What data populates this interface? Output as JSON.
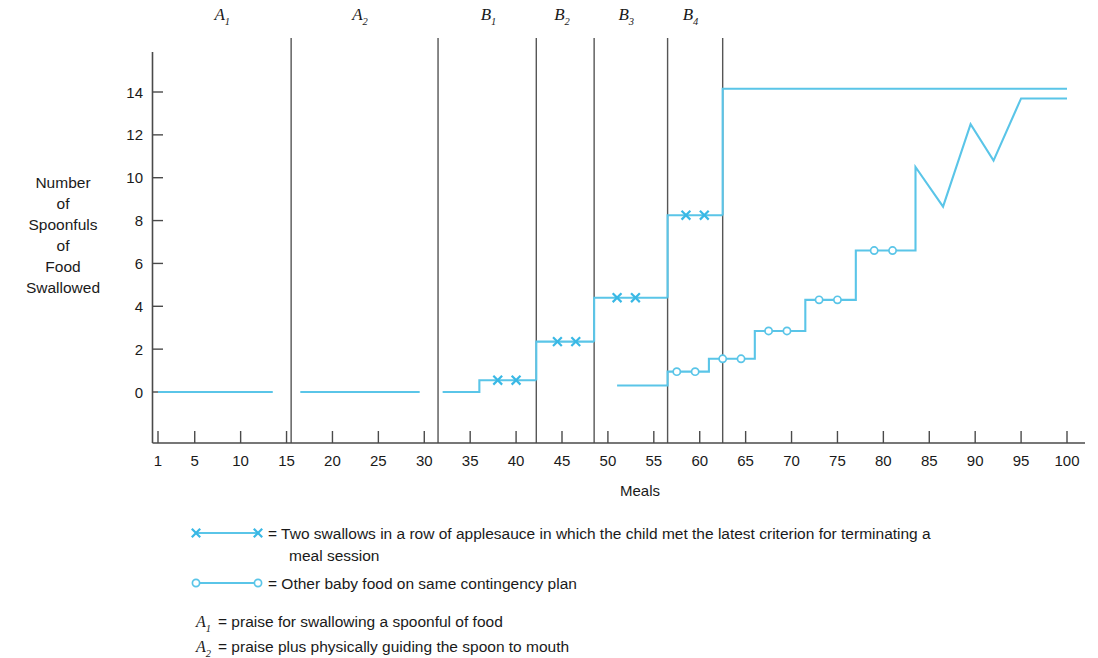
{
  "chart_data": {
    "type": "line",
    "title": "",
    "xlabel": "Meals",
    "ylabel": "Number of Spoonfuls of Food Swallowed",
    "ylabel_lines": [
      "Number",
      "of",
      "Spoonfuls",
      "of",
      "Food",
      "Swallowed"
    ],
    "xlim": [
      1,
      100
    ],
    "ylim": [
      0,
      15
    ],
    "ytick_labels": [
      "0",
      "2",
      "4",
      "6",
      "8",
      "10",
      "12",
      "14"
    ],
    "yticks": [
      0,
      2,
      4,
      6,
      8,
      10,
      12,
      14
    ],
    "xtick_labels": [
      "1",
      "5",
      "10",
      "15",
      "20",
      "25",
      "30",
      "35",
      "40",
      "45",
      "50",
      "55",
      "60",
      "65",
      "70",
      "75",
      "80",
      "85",
      "90",
      "95",
      "100"
    ],
    "xticks": [
      1,
      5,
      10,
      15,
      20,
      25,
      30,
      35,
      40,
      45,
      50,
      55,
      60,
      65,
      70,
      75,
      80,
      85,
      90,
      95,
      100
    ],
    "grid": false,
    "legend_position": "below-plot",
    "phases": [
      {
        "label": "A",
        "sub": "1",
        "start": 1,
        "end": 15,
        "label_x": 8
      },
      {
        "label": "A",
        "sub": "2",
        "start": 16,
        "end": 31,
        "label_x": 23
      },
      {
        "label": "B",
        "sub": "1",
        "start": 32,
        "end": 42,
        "label_x": 37
      },
      {
        "label": "B",
        "sub": "2",
        "start": 43,
        "end": 48,
        "label_x": 45
      },
      {
        "label": "B",
        "sub": "3",
        "start": 49,
        "end": 56,
        "label_x": 52
      },
      {
        "label": "B",
        "sub": "4",
        "start": 57,
        "end": 62,
        "label_x": 59
      }
    ],
    "phase_divider_meals": [
      15.5,
      31.5,
      42.2,
      48.5,
      56.5,
      62.5
    ],
    "series": [
      {
        "name": "Applesauce (two swallows in a row criterion)",
        "marker": "x",
        "marker_color": "#39b8e5",
        "line_color": "#5ac5e8",
        "segments": [
          {
            "phase": "A1",
            "points": [
              [
                1,
                0
              ],
              [
                13.5,
                0
              ]
            ],
            "markers": []
          },
          {
            "phase": "A2",
            "points": [
              [
                16.5,
                0
              ],
              [
                29.5,
                0
              ]
            ],
            "markers": []
          },
          {
            "phase": "B1",
            "points": [
              [
                32,
                0
              ],
              [
                36,
                0
              ],
              [
                36,
                0.55
              ],
              [
                42.2,
                0.55
              ]
            ],
            "markers": [
              [
                38,
                0.55
              ],
              [
                40,
                0.55
              ]
            ]
          },
          {
            "phase": "B2",
            "points": [
              [
                42.2,
                0.55
              ],
              [
                42.2,
                2.35
              ],
              [
                48.5,
                2.35
              ]
            ],
            "markers": [
              [
                44.5,
                2.35
              ],
              [
                46.5,
                2.35
              ]
            ]
          },
          {
            "phase": "B3",
            "points": [
              [
                48.5,
                2.35
              ],
              [
                48.5,
                4.4
              ],
              [
                56.5,
                4.4
              ]
            ],
            "markers": [
              [
                51,
                4.4
              ],
              [
                53,
                4.4
              ]
            ]
          },
          {
            "phase": "B4",
            "points": [
              [
                56.5,
                4.4
              ],
              [
                56.5,
                8.25
              ],
              [
                62.5,
                8.25
              ]
            ],
            "markers": [
              [
                58.5,
                8.25
              ],
              [
                60.5,
                8.25
              ]
            ]
          },
          {
            "phase": "maintenance",
            "points": [
              [
                62.5,
                8.25
              ],
              [
                62.5,
                14.15
              ],
              [
                100,
                14.15
              ]
            ],
            "markers": []
          }
        ]
      },
      {
        "name": "Other baby food on same contingency plan",
        "marker": "o",
        "marker_color": "#5ac5e8",
        "line_color": "#5ac5e8",
        "segments": [
          {
            "phase": "baby-food",
            "points": [
              [
                51,
                0.3
              ],
              [
                56.5,
                0.3
              ],
              [
                56.5,
                0.95
              ],
              [
                61,
                0.95
              ],
              [
                61,
                1.55
              ],
              [
                66,
                1.55
              ],
              [
                66,
                2.85
              ],
              [
                71.5,
                2.85
              ],
              [
                71.5,
                4.3
              ],
              [
                77,
                4.3
              ],
              [
                77,
                6.6
              ],
              [
                83.5,
                6.6
              ],
              [
                83.5,
                10.5
              ],
              [
                86.5,
                8.65
              ],
              [
                86.5,
                8.65
              ],
              [
                89.5,
                12.5
              ],
              [
                89.5,
                12.5
              ],
              [
                92,
                10.8
              ],
              [
                92,
                10.8
              ],
              [
                95,
                13.7
              ],
              [
                95,
                13.7
              ],
              [
                100,
                13.7
              ]
            ],
            "markers": [
              [
                57.5,
                0.95
              ],
              [
                59.5,
                0.95
              ],
              [
                62.5,
                1.55
              ],
              [
                64.5,
                1.55
              ],
              [
                67.5,
                2.85
              ],
              [
                69.5,
                2.85
              ],
              [
                73,
                4.3
              ],
              [
                75,
                4.3
              ],
              [
                79,
                6.6
              ],
              [
                81,
                6.6
              ]
            ]
          }
        ]
      }
    ]
  },
  "legend": {
    "entries": [
      {
        "marker": "x",
        "text_line1": "= Two swallows in a row of applesauce in which the child met the latest criterion for terminating a",
        "text_line2": "meal session"
      },
      {
        "marker": "o",
        "text_line1": "= Other baby food on same contingency plan",
        "text_line2": ""
      }
    ]
  },
  "notes": [
    {
      "symbol": "A",
      "sub": "1",
      "text": "= praise for swallowing a spoonful of food"
    },
    {
      "symbol": "A",
      "sub": "2",
      "text": "= praise plus physically guiding the spoon to mouth"
    }
  ]
}
